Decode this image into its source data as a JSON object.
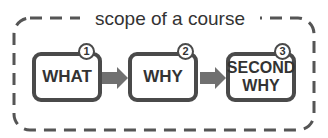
{
  "scope": {
    "title": "scope of a course",
    "border_color": "#555555"
  },
  "steps": [
    {
      "number": "1",
      "label": "WHAT"
    },
    {
      "number": "2",
      "label": "WHY"
    },
    {
      "number": "3",
      "label": "SECOND WHY"
    }
  ],
  "colors": {
    "box_border": "#4a4a4a",
    "arrow": "#707070",
    "text": "#333333"
  }
}
